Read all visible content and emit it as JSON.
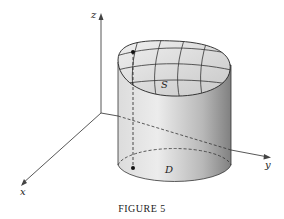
{
  "figure": {
    "caption": "FIGURE 5",
    "axes": {
      "x_label": "x",
      "y_label": "y",
      "z_label": "z"
    },
    "labels": {
      "surface": "S",
      "region": "D"
    },
    "colors": {
      "cylinder_light": "#e6e6e6",
      "cylinder_dark": "#8a8a8a",
      "surface_fill": "#d9d9d9",
      "stroke": "#2a2a2a"
    }
  }
}
